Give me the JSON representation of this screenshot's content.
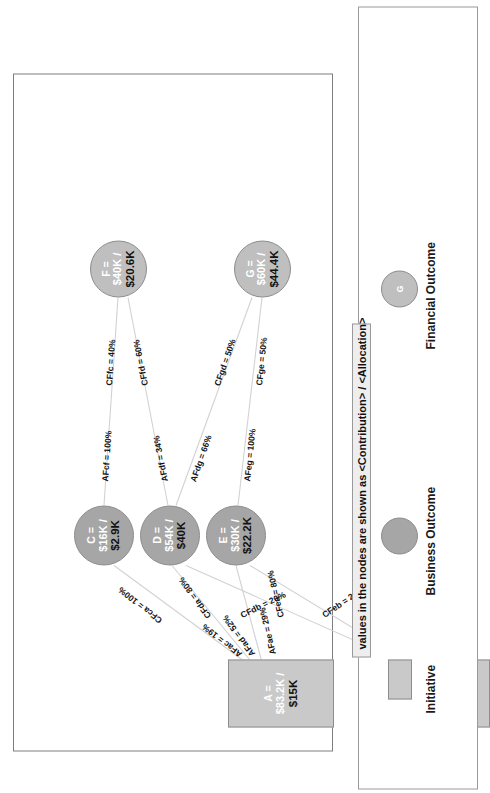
{
  "diagram": {
    "title_note": "values in the nodes are shown as <Contribution> / <Allocation>",
    "nodes": {
      "A": {
        "id": "A =",
        "contribution": "$83.2K /",
        "allocation": "$15K",
        "type": "initiative"
      },
      "B": {
        "id": "B =",
        "contribution": "$16.8K /",
        "allocation": "$50K",
        "type": "initiative"
      },
      "C": {
        "id": "C =",
        "contribution": "$16K /",
        "allocation": "$2.9K",
        "type": "business-outcome"
      },
      "D": {
        "id": "D =",
        "contribution": "$54K /",
        "allocation": "$40K",
        "type": "business-outcome"
      },
      "E": {
        "id": "E =",
        "contribution": "$30K /",
        "allocation": "$22.2K",
        "type": "business-outcome"
      },
      "F": {
        "id": "F =",
        "contribution": "$40K /",
        "allocation": "$20.6K",
        "type": "financial-outcome"
      },
      "G": {
        "id": "G =",
        "contribution": "$60K /",
        "allocation": "$44.4K",
        "type": "financial-outcome"
      }
    },
    "edges": {
      "AFac": "AFac = 19%",
      "AFad": "AFad = 52%",
      "AFae": "AFae = 29%",
      "AFbd": "AFbd = 64%",
      "AFbe": "AFbe = 36%",
      "CFca": "CFca = 100%",
      "CFda": "CFda = 80%",
      "CFdb": "CFdb = 20%",
      "CFea": "CFea = 80%",
      "CFeb": "CFeb = 20%",
      "AFcf": "AFcf = 100%",
      "AFdf": "AFdf = 34%",
      "AFdg": "AFdg = 66%",
      "AFeg": "AFeg = 100%",
      "CFfc": "CFfc = 40%",
      "CFfd": "CFfd = 60%",
      "CFgd": "CFgd = 50%",
      "CFge": "CFge = 50%"
    }
  },
  "legend": {
    "initiative_label": "Initiative",
    "business_outcome_label": "Business Outcome",
    "financial_outcome_label": "Financial Outcome",
    "financial_outcome_glyph": "G",
    "note": "values in the nodes are shown as <Contribution> / <Allocation>"
  },
  "colors": {
    "business_outcome_fill": "#a6a6a6",
    "financial_outcome_fill": "#bfbfbf",
    "initiative_fill": "#c9c9c9",
    "edge_stroke": "#d2d2d2",
    "frame_stroke": "#7e7e7e"
  }
}
